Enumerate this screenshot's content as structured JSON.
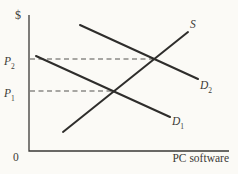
{
  "figure": {
    "background": "#fbfaf6",
    "curve_color": "#2e2d2b",
    "axis_color": "#3a3936",
    "text_color": "#3b3a37"
  },
  "labels": {
    "y_axis_symbol": "$",
    "origin": "0",
    "x_axis": "PC software",
    "price_upper": {
      "base": "P",
      "sub": "2"
    },
    "price_lower": {
      "base": "P",
      "sub": "1"
    },
    "supply": {
      "base": "S",
      "sub": ""
    },
    "demand_shifted": {
      "base": "D",
      "sub": "2"
    },
    "demand_initial": {
      "base": "D",
      "sub": "1"
    }
  },
  "chart_data": {
    "type": "line",
    "ylabel": "$",
    "xlabel": "PC software",
    "origin_label": "0",
    "axes_numeric_scale": false,
    "grid": false,
    "series": [
      {
        "name": "S",
        "kind": "supply",
        "slope": "up",
        "endpoints_norm": [
          [
            0.17,
            0.14
          ],
          [
            0.8,
            0.88
          ]
        ]
      },
      {
        "name": "D1",
        "kind": "demand-initial",
        "slope": "down",
        "endpoints_norm": [
          [
            0.04,
            0.7
          ],
          [
            0.71,
            0.25
          ]
        ]
      },
      {
        "name": "D2",
        "kind": "demand-shifted",
        "slope": "down",
        "endpoints_norm": [
          [
            0.26,
            0.93
          ],
          [
            0.85,
            0.53
          ]
        ]
      }
    ],
    "price_lines": [
      {
        "name": "P2",
        "style": "dashed",
        "y_norm": 0.68,
        "ends_at": "intersection of S and D2"
      },
      {
        "name": "P1",
        "style": "dashed",
        "y_norm": 0.44,
        "ends_at": "intersection of S and D1"
      }
    ],
    "equilibria": [
      {
        "curves": "S x D1",
        "price_label": "P1"
      },
      {
        "curves": "S x D2",
        "price_label": "P2"
      }
    ],
    "geometry_px": {
      "canvas": {
        "w": 238,
        "h": 174
      },
      "axes": {
        "x0": 29,
        "y_top": 15,
        "y_bottom": 151,
        "x_right": 229
      },
      "curves": [
        {
          "id": "supply-curve",
          "x1": 63,
          "y1": 132,
          "x2": 188,
          "y2": 32
        },
        {
          "id": "demand1-curve",
          "x1": 36,
          "y1": 56,
          "x2": 170,
          "y2": 117
        },
        {
          "id": "demand2-curve",
          "x1": 80,
          "y1": 25,
          "x2": 198,
          "y2": 79
        }
      ],
      "dashed": [
        {
          "id": "p2-guide-line",
          "x1": 30,
          "y1": 59,
          "x2": 154,
          "y2": 59
        },
        {
          "id": "p1-guide-line",
          "x1": 30,
          "y1": 91,
          "x2": 114,
          "y2": 91
        }
      ]
    }
  }
}
